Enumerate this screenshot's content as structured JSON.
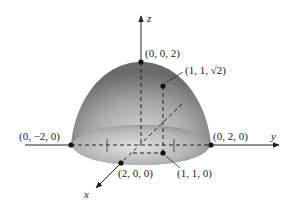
{
  "figure": {
    "type": "3d-surface-diagram",
    "surface": "paraboloid-like dome over disk of radius 2",
    "axes": {
      "x": "x",
      "y": "y",
      "z": "z"
    },
    "points": [
      {
        "id": "top",
        "label": "(0, 0, 2)"
      },
      {
        "id": "surface-point",
        "label": "(1, 1, √2)"
      },
      {
        "id": "y-neg",
        "label": "(0, −2, 0)"
      },
      {
        "id": "y-pos",
        "label": "(0, 2, 0)"
      },
      {
        "id": "x-pos",
        "label": "(2, 0, 0)"
      },
      {
        "id": "base-point",
        "label": "(1, 1, 0)"
      }
    ],
    "colors": {
      "surface_dark": "#6e6e6e",
      "surface_light": "#d8d8d8",
      "line": "#222222"
    }
  }
}
